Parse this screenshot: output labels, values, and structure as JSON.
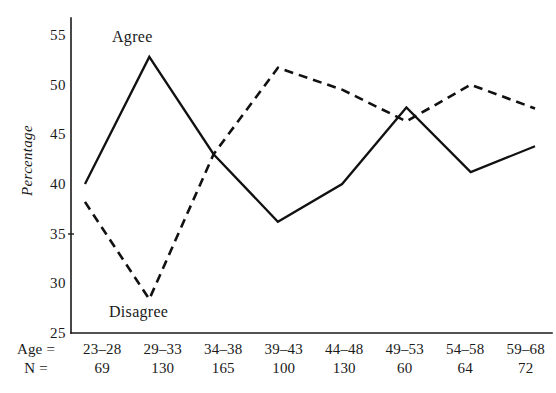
{
  "chart_data": {
    "type": "line",
    "title": "",
    "xlabel": "",
    "ylabel": "Percentage",
    "ylim": [
      25,
      57
    ],
    "yticks": [
      25,
      30,
      35,
      40,
      45,
      50,
      55
    ],
    "grid": false,
    "legend_position": "inline-annotation",
    "categories": [
      "23–28",
      "29–33",
      "34–38",
      "39–43",
      "44–48",
      "49–53",
      "54–58",
      "59–68"
    ],
    "series": [
      {
        "name": "Agree",
        "style": "solid",
        "values": [
          40.0,
          52.8,
          43.0,
          36.2,
          40.0,
          47.7,
          41.2,
          43.8
        ]
      },
      {
        "name": "Disagree",
        "style": "dashed",
        "values": [
          38.2,
          28.4,
          43.0,
          51.7,
          49.5,
          46.3,
          50.0,
          47.6
        ]
      }
    ],
    "annotations": [
      {
        "text": "Agree",
        "series": "Agree"
      },
      {
        "text": "Disagree",
        "series": "Disagree"
      }
    ]
  },
  "axis": {
    "y_label": "Percentage",
    "y_tick_labels": [
      "55",
      "50",
      "45",
      "40",
      "35",
      "30",
      "25"
    ]
  },
  "bottom_table": {
    "row_age_label": "Age =",
    "row_n_label": "N =",
    "age_groups": [
      "23–28",
      "29–33",
      "34–38",
      "39–43",
      "44–48",
      "49–53",
      "54–58",
      "59–68"
    ],
    "n_values": [
      "69",
      "130",
      "165",
      "100",
      "130",
      "60",
      "64",
      "72"
    ]
  },
  "annotations": {
    "agree": "Agree",
    "disagree": "Disagree"
  },
  "colors": {
    "ink": "#111111",
    "background": "#ffffff"
  }
}
